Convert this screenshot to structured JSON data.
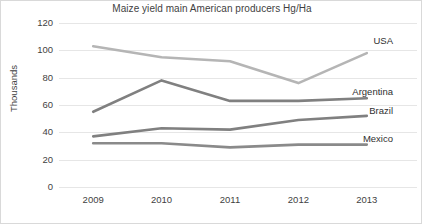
{
  "chart_data": {
    "type": "line",
    "title": "Maize yield main American producers Hg/Ha",
    "xlabel": "",
    "ylabel": "Thousands",
    "categories": [
      "2009",
      "2010",
      "2011",
      "2012",
      "2013"
    ],
    "x": [
      2009,
      2010,
      2011,
      2012,
      2013
    ],
    "ylim": [
      0,
      120
    ],
    "yticks": [
      0,
      20,
      40,
      60,
      80,
      100,
      120
    ],
    "ytick_labels": [
      "0",
      "20",
      "40",
      "60",
      "80",
      "100",
      "120"
    ],
    "grid": "horizontal",
    "legend_position": "inline-right-of-line-ends",
    "series": [
      {
        "name": "USA",
        "values": [
          103,
          95,
          92,
          76,
          98
        ],
        "color": "#b5b5b5",
        "label": "USA"
      },
      {
        "name": "Argentina",
        "values": [
          55,
          78,
          63,
          63,
          65
        ],
        "color": "#808080",
        "label": "Argentina"
      },
      {
        "name": "Brazil",
        "values": [
          37,
          43,
          42,
          49,
          52
        ],
        "color": "#808080",
        "label": "Brazil"
      },
      {
        "name": "Mexico",
        "values": [
          32,
          32,
          29,
          31,
          31
        ],
        "color": "#8a8a8a",
        "label": "Mexico"
      }
    ]
  },
  "colors": {
    "background": "#ffffff",
    "border": "#d9d9d9",
    "gridline": "#e6e6e6",
    "text": "#3f3f3f",
    "usa": "#b5b5b5",
    "argentina": "#808080",
    "brazil": "#808080",
    "mexico": "#8a8a8a"
  }
}
